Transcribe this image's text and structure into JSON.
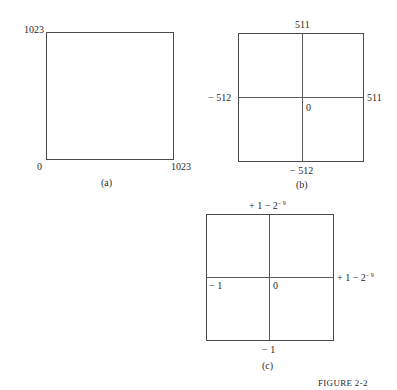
{
  "figure_label": "FIGURE 2-2",
  "panels": {
    "a": {
      "caption": "(a)",
      "labels": {
        "top_left": "1023",
        "bottom_left": "0",
        "bottom_right": "1023"
      }
    },
    "b": {
      "caption": "(b)",
      "labels": {
        "top": "511",
        "bottom": "− 512",
        "left": "− 512",
        "right": "511",
        "center": "0"
      }
    },
    "c": {
      "caption": "(c)",
      "labels": {
        "top": "+ 1 − 2",
        "top_exp": "− 9",
        "right": "+ 1 − 2",
        "right_exp": "− 9",
        "left": "− 1",
        "bottom": "− 1",
        "center": "0"
      }
    }
  }
}
